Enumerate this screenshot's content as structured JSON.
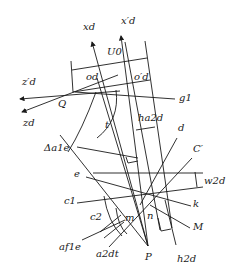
{
  "diagram": {
    "type": "geometric-construction",
    "colors": {
      "line": "#1a1a1a",
      "background": "#ffffff"
    },
    "labels": [
      {
        "id": "xd_prime",
        "text": "x′d",
        "x": 121,
        "y": 24
      },
      {
        "id": "xd",
        "text": "xd",
        "x": 83,
        "y": 30
      },
      {
        "id": "U0",
        "text": "U0",
        "x": 107,
        "y": 55
      },
      {
        "id": "od",
        "text": "od",
        "x": 86,
        "y": 80
      },
      {
        "id": "od_prime",
        "text": "o′d",
        "x": 134,
        "y": 80
      },
      {
        "id": "zd_prime",
        "text": "z′d",
        "x": 22,
        "y": 85
      },
      {
        "id": "g1",
        "text": "g1",
        "x": 179,
        "y": 101
      },
      {
        "id": "Q",
        "text": "Q",
        "x": 58,
        "y": 107
      },
      {
        "id": "zd",
        "text": "zd",
        "x": 23,
        "y": 126
      },
      {
        "id": "h_a2d",
        "text": "ha2d",
        "x": 138,
        "y": 121
      },
      {
        "id": "t",
        "text": "t",
        "x": 105,
        "y": 128
      },
      {
        "id": "d",
        "text": "d",
        "x": 178,
        "y": 131
      },
      {
        "id": "delta_a1e",
        "text": "Δa1e",
        "x": 44,
        "y": 151
      },
      {
        "id": "C_prime",
        "text": "C′",
        "x": 193,
        "y": 152
      },
      {
        "id": "e",
        "text": "e",
        "x": 74,
        "y": 177
      },
      {
        "id": "w2d",
        "text": "w2d",
        "x": 204,
        "y": 184
      },
      {
        "id": "c1",
        "text": "c1",
        "x": 64,
        "y": 204
      },
      {
        "id": "k",
        "text": "k",
        "x": 193,
        "y": 207
      },
      {
        "id": "c2",
        "text": "c2",
        "x": 90,
        "y": 220
      },
      {
        "id": "m",
        "text": "m",
        "x": 125,
        "y": 221
      },
      {
        "id": "n",
        "text": "n",
        "x": 147,
        "y": 219
      },
      {
        "id": "M",
        "text": "M",
        "x": 193,
        "y": 230
      },
      {
        "id": "a_f1e",
        "text": "af1e",
        "x": 59,
        "y": 250
      },
      {
        "id": "a_2dt",
        "text": "a2dt",
        "x": 96,
        "y": 257
      },
      {
        "id": "P",
        "text": "P",
        "x": 145,
        "y": 260
      },
      {
        "id": "h_2d",
        "text": "h2d",
        "x": 177,
        "y": 262
      }
    ],
    "lines": [
      {
        "id": "axis-xd",
        "x1": 148,
        "y1": 246,
        "x2": 92,
        "y2": 42,
        "arrow": true
      },
      {
        "id": "axis-xd-prime",
        "x1": 148,
        "y1": 246,
        "x2": 121,
        "y2": 36,
        "arrow": true
      },
      {
        "id": "axis-zd-prime",
        "x1": 120,
        "y1": 91,
        "x2": 20,
        "y2": 99,
        "arrow": true
      },
      {
        "id": "axis-zd",
        "x1": 118,
        "y1": 75,
        "x2": 22,
        "y2": 112,
        "arrow": true
      },
      {
        "id": "line-g1",
        "x1": 75,
        "y1": 92,
        "x2": 175,
        "y2": 99
      },
      {
        "id": "frame-left",
        "x1": 71,
        "y1": 61,
        "x2": 73,
        "y2": 92
      },
      {
        "id": "frame-right",
        "x1": 145,
        "y1": 41,
        "x2": 172,
        "y2": 228
      },
      {
        "id": "frame-top",
        "x1": 72,
        "y1": 70,
        "x2": 147,
        "y2": 58
      },
      {
        "id": "frame-mid",
        "x1": 73,
        "y1": 92,
        "x2": 150,
        "y2": 80
      },
      {
        "id": "frame-mid2",
        "x1": 125,
        "y1": 42,
        "x2": 160,
        "y2": 230
      },
      {
        "id": "h-a2d-box",
        "x1": 136,
        "y1": 130,
        "x2": 155,
        "y2": 127
      },
      {
        "id": "line-d",
        "x1": 177,
        "y1": 138,
        "x2": 140,
        "y2": 205
      },
      {
        "id": "line-Cprime",
        "x1": 192,
        "y1": 158,
        "x2": 109,
        "y2": 247
      },
      {
        "id": "line-delta",
        "x1": 77,
        "y1": 147,
        "x2": 138,
        "y2": 158
      },
      {
        "id": "line-e1",
        "x1": 93,
        "y1": 173,
        "x2": 203,
        "y2": 173
      },
      {
        "id": "line-e2",
        "x1": 86,
        "y1": 177,
        "x2": 191,
        "y2": 206
      },
      {
        "id": "line-c1",
        "x1": 77,
        "y1": 203,
        "x2": 203,
        "y2": 187
      },
      {
        "id": "line-M",
        "x1": 150,
        "y1": 205,
        "x2": 190,
        "y2": 228
      },
      {
        "id": "line-af1e",
        "x1": 82,
        "y1": 240,
        "x2": 125,
        "y2": 220
      },
      {
        "id": "line-h2d",
        "x1": 165,
        "y1": 200,
        "x2": 176,
        "y2": 245
      },
      {
        "id": "line-to-P-1",
        "x1": 60,
        "y1": 135,
        "x2": 148,
        "y2": 246
      },
      {
        "id": "line-to-P-2",
        "x1": 97,
        "y1": 78,
        "x2": 148,
        "y2": 246
      }
    ]
  }
}
